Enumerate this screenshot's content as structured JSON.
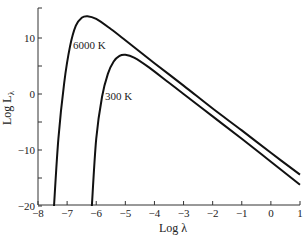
{
  "chart_data": {
    "type": "line",
    "title": "",
    "xlabel": "Log λ",
    "ylabel": "Log L",
    "ylabel_sub": "λ",
    "xlim": [
      -8,
      1
    ],
    "ylim": [
      -20,
      15
    ],
    "x_ticks": [
      -8,
      -7,
      -6,
      -5,
      -4,
      -3,
      -2,
      -1,
      0,
      1
    ],
    "x_tick_labels": [
      "−8",
      "−7",
      "−6",
      "−5",
      "−4",
      "−3",
      "−2",
      "−1",
      "0",
      "1"
    ],
    "y_ticks": [
      -20,
      -15,
      -10,
      -5,
      0,
      5,
      10
    ],
    "y_tick_labels": [
      "−20",
      "",
      "−10",
      "",
      "0",
      "",
      "10"
    ],
    "grid": false,
    "legend": "inline annotations",
    "series": [
      {
        "name": "6000 K",
        "label": "6000 K",
        "x": [
          -7.45,
          -7.3,
          -7.1,
          -6.9,
          -6.7,
          -6.5,
          -6.3,
          -6.0,
          -5.5,
          -5.0,
          -4.0,
          -3.0,
          -2.0,
          -1.0,
          0.0,
          1.0
        ],
        "y": [
          -20,
          -8,
          2,
          8.5,
          12.2,
          13.6,
          13.9,
          13.4,
          11.6,
          9.6,
          5.5,
          1.5,
          -2.6,
          -6.5,
          -10.5,
          -14.4
        ]
      },
      {
        "name": "300 K",
        "label": "300 K",
        "x": [
          -6.15,
          -6.0,
          -5.8,
          -5.6,
          -5.4,
          -5.2,
          -5.0,
          -4.7,
          -4.2,
          -3.5,
          -3.0,
          -2.0,
          -1.0,
          0.0,
          1.0
        ],
        "y": [
          -20,
          -8,
          -0.5,
          3.6,
          5.8,
          6.8,
          7.0,
          6.5,
          4.8,
          2.0,
          0.0,
          -4.0,
          -8.0,
          -12.1,
          -16.2
        ]
      }
    ],
    "annotations": [
      {
        "text": "6000 K",
        "x": -6.8,
        "y": 8
      },
      {
        "text": "300 K",
        "x": -5.7,
        "y": -1
      }
    ]
  }
}
